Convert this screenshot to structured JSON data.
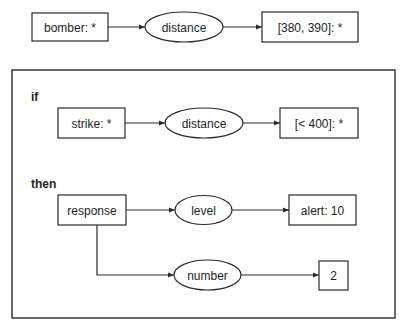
{
  "diagram": {
    "fact": {
      "source": {
        "label": "bomber: *"
      },
      "relation": {
        "label": "distance"
      },
      "target": {
        "label": "[380, 390]: *"
      }
    },
    "rule": {
      "if_label": "if",
      "then_label": "then",
      "condition": {
        "source": {
          "label": "strike: *"
        },
        "relation": {
          "label": "distance"
        },
        "target": {
          "label": "[< 400]: *"
        }
      },
      "consequence": {
        "source": {
          "label": "response"
        },
        "branches": [
          {
            "relation": {
              "label": "level"
            },
            "target": {
              "label": "alert: 10"
            }
          },
          {
            "relation": {
              "label": "number"
            },
            "target": {
              "label": "2"
            }
          }
        ]
      }
    },
    "colors": {
      "stroke": "#2a2a2a",
      "text": "#1e1e1e",
      "background": "#ffffff"
    }
  }
}
